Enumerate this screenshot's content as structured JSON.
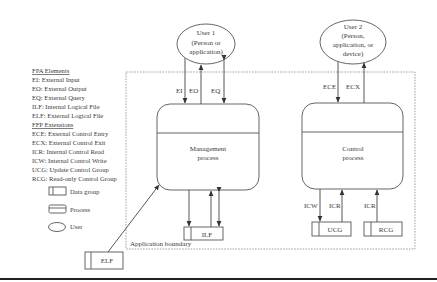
{
  "legend": {
    "fpa_title": "FPA Elements",
    "fpa_items": [
      "EI: External Input",
      "EO: External Output",
      "EQ: External Query",
      "ILF: Internal Logical File",
      "ELF: External Logical File"
    ],
    "ffp_title": "FFP Extensions",
    "ffp_items": [
      "ECE: External Control Entry",
      "ECX: External Control Exit",
      "ICR: Internal Control Read",
      "ICW: Internal Control Write",
      "UCG: Update Control Group",
      "RCG: Read-only Control Group"
    ],
    "symbols": [
      {
        "shape": "data-group",
        "label": "Data group"
      },
      {
        "shape": "process",
        "label": "Process"
      },
      {
        "shape": "user",
        "label": "User"
      }
    ]
  },
  "users": [
    {
      "id": "user1",
      "lines": [
        "User 1",
        "(Person or",
        "application)"
      ]
    },
    {
      "id": "user2",
      "lines": [
        "User 2",
        "(Person,",
        "application, or",
        "device)"
      ]
    }
  ],
  "processes": [
    {
      "id": "management",
      "lines": [
        "Management",
        "process"
      ]
    },
    {
      "id": "control",
      "lines": [
        "Control",
        "process"
      ]
    }
  ],
  "flows": {
    "user1": [
      "EI",
      "EO",
      "EQ"
    ],
    "user2": [
      "ECE",
      "ECX"
    ],
    "control_down": [
      "ICW",
      "ICR",
      "ICR"
    ]
  },
  "data_groups": {
    "ilf": "ILF",
    "ucg": "UCG",
    "rcg": "RCG",
    "elf": "ELF"
  },
  "boundary_label": "Application boundary"
}
